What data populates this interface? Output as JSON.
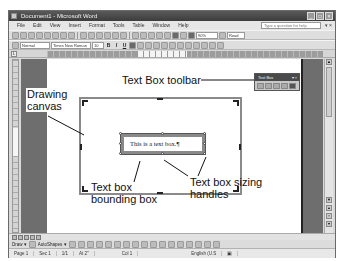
{
  "window": {
    "title": "Document1 - Microsoft Word",
    "controls": [
      "minimize",
      "maximize",
      "close"
    ]
  },
  "menubar": {
    "items": [
      "File",
      "Edit",
      "View",
      "Insert",
      "Format",
      "Tools",
      "Table",
      "Window",
      "Help"
    ],
    "help_placeholder": "Type a question for help"
  },
  "standard_toolbar": {
    "zoom": "90%",
    "read_label": "Read"
  },
  "formatting_toolbar": {
    "style": "Normal",
    "font": "Times New Roman",
    "size": "10",
    "bold": "B",
    "italic": "I",
    "underline": "U"
  },
  "floating_toolbar": {
    "title": "Text Box",
    "close": "x"
  },
  "document": {
    "textbox_text": "This is a text box.¶"
  },
  "callouts": {
    "toolbar": "Text Box toolbar",
    "canvas_line1": "Drawing",
    "canvas_line2": "canvas",
    "bounding_line1": "Text box",
    "bounding_line2": "bounding box",
    "handles_line1": "Text box sizing",
    "handles_line2": "handles"
  },
  "drawing_toolbar": {
    "draw_label": "Draw ▾",
    "autoshapes_label": "AutoShapes ▾"
  },
  "status_bar": {
    "page": "Page 1",
    "section": "Sec 1",
    "page_of": "1/1",
    "at": "At 2\"",
    "ln": "",
    "col": "Col 1",
    "language": "English (U.S"
  }
}
